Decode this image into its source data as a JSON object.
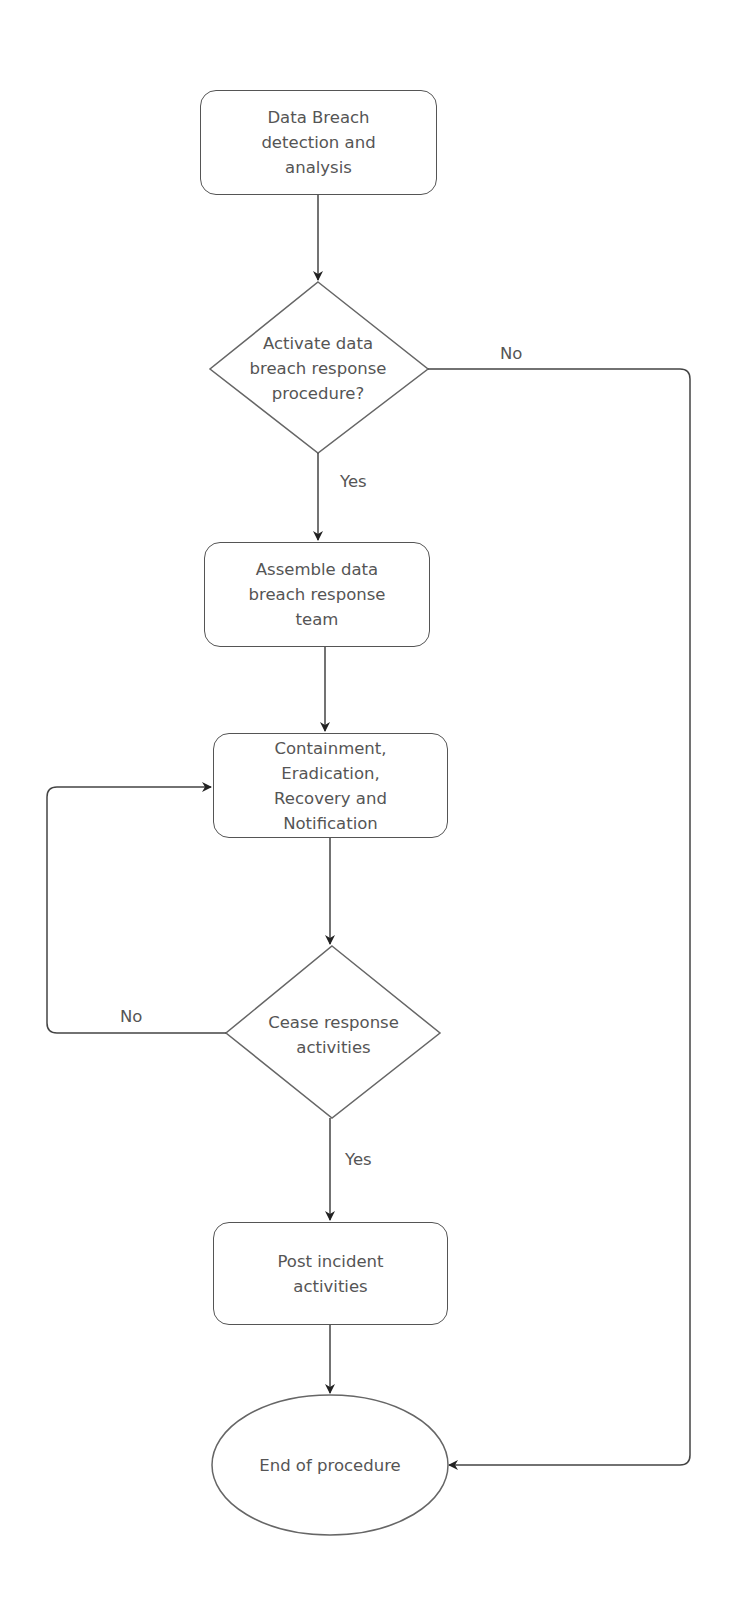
{
  "diagram": {
    "type": "flowchart",
    "nodes": [
      {
        "id": "detect",
        "shape": "rounded-rect",
        "text": "Data Breach detection and analysis",
        "lines": [
          "Data Breach",
          "detection and",
          "analysis"
        ]
      },
      {
        "id": "activate",
        "shape": "diamond",
        "text": "Activate data breach response procedure?",
        "lines": [
          "Activate data",
          "breach response",
          "procedure?"
        ]
      },
      {
        "id": "assemble",
        "shape": "rounded-rect",
        "text": "Assemble data breach response team",
        "lines": [
          "Assemble data",
          "breach response",
          "team"
        ]
      },
      {
        "id": "contain",
        "shape": "rounded-rect",
        "text": "Containment, Eradication, Recovery and Notification",
        "lines": [
          "Containment,",
          "Eradication,",
          "Recovery and",
          "Notification"
        ]
      },
      {
        "id": "cease",
        "shape": "diamond",
        "text": "Cease response activities",
        "lines": [
          "Cease response",
          "activities"
        ]
      },
      {
        "id": "post",
        "shape": "rounded-rect",
        "text": "Post incident activities",
        "lines": [
          "Post incident",
          "activities"
        ]
      },
      {
        "id": "end",
        "shape": "ellipse",
        "text": "End of procedure",
        "lines": [
          "End of procedure"
        ]
      }
    ],
    "edges": [
      {
        "from": "detect",
        "to": "activate",
        "label": ""
      },
      {
        "from": "activate",
        "to": "assemble",
        "label": "Yes"
      },
      {
        "from": "activate",
        "to": "end",
        "label": "No"
      },
      {
        "from": "assemble",
        "to": "contain",
        "label": ""
      },
      {
        "from": "contain",
        "to": "cease",
        "label": ""
      },
      {
        "from": "cease",
        "to": "contain",
        "label": "No"
      },
      {
        "from": "cease",
        "to": "post",
        "label": "Yes"
      },
      {
        "from": "post",
        "to": "end",
        "label": ""
      }
    ],
    "labels": {
      "activate_no": "No",
      "activate_yes": "Yes",
      "cease_no": "No",
      "cease_yes": "Yes"
    },
    "colors": {
      "stroke": "#555555",
      "text": "#555555",
      "background": "#ffffff"
    }
  }
}
